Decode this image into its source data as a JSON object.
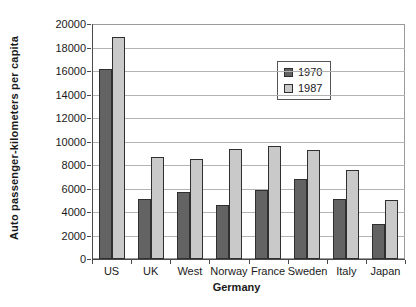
{
  "chart_data": {
    "type": "bar",
    "categories": [
      "US",
      "UK",
      "West",
      "Norway",
      "France",
      "Sweden",
      "Italy",
      "Japan"
    ],
    "series": [
      {
        "name": "1970",
        "color": "#636363",
        "values": [
          16200,
          5100,
          5700,
          4600,
          5900,
          6800,
          5100,
          3000
        ]
      },
      {
        "name": "1987",
        "color": "#c9c9c9",
        "values": [
          18900,
          8700,
          8500,
          9400,
          9600,
          9300,
          7600,
          5000
        ]
      }
    ],
    "xlabel": "Germany",
    "ylabel": "Auto passenger-kilometers per capita",
    "ylim": [
      0,
      20000
    ],
    "yticks": [
      0,
      2000,
      4000,
      6000,
      8000,
      10000,
      12000,
      14000,
      16000,
      18000,
      20000
    ],
    "grid": true,
    "legend_position": "inside-top-center",
    "gridline_color": "#b3b3b3",
    "axis_color": "#4a4a4a",
    "plot_border_color": "#9a9a9a",
    "bar_outline_color": "#2f2f2f"
  }
}
